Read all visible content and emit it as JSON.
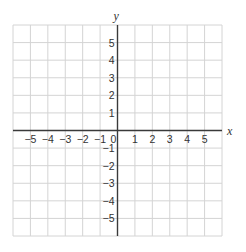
{
  "chart_data": {
    "type": "scatter",
    "title": "",
    "xlabel": "x",
    "ylabel": "y",
    "xlim": [
      -6,
      6
    ],
    "ylim": [
      -6,
      6
    ],
    "grid": true,
    "grid_step": 1,
    "x_ticks": [
      -5,
      -4,
      -3,
      -2,
      -1,
      0,
      1,
      2,
      3,
      4,
      5
    ],
    "y_ticks": [
      5,
      4,
      3,
      2,
      1,
      -1,
      -2,
      -3,
      -4,
      -5
    ],
    "x_tick_labels": [
      "−5",
      "−4",
      "−3",
      "−2",
      "−1",
      "0",
      "1",
      "2",
      "3",
      "4",
      "5"
    ],
    "y_tick_labels": [
      "5",
      "4",
      "3",
      "2",
      "1",
      "−1",
      "−2",
      "−3",
      "−4",
      "−5"
    ],
    "series": [],
    "legend": null
  },
  "colors": {
    "grid": "#d4d4d4",
    "axis": "#3a3a3a",
    "text": "#333333",
    "background": "#ffffff"
  }
}
